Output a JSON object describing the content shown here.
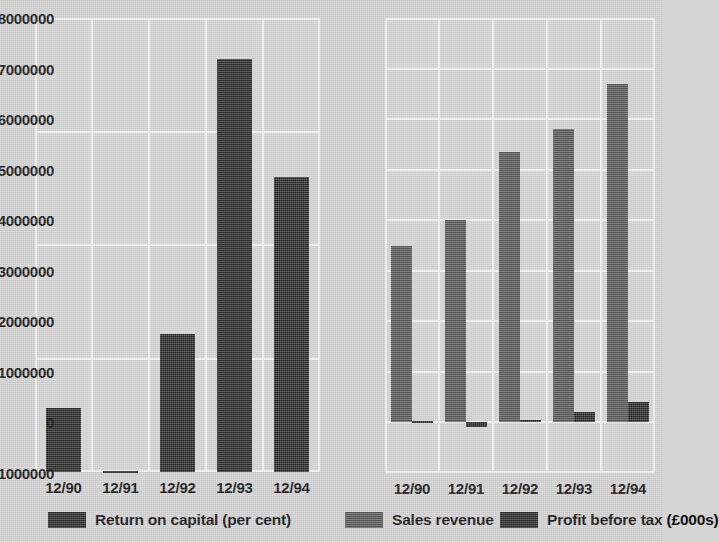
{
  "chart_data": [
    {
      "type": "bar",
      "title": "",
      "id": "return-on-capital",
      "position": "left",
      "categories": [
        "12/90",
        "12/91",
        "12/92",
        "12/93",
        "12/94"
      ],
      "series": [
        {
          "name": "Return on capital (per cent)",
          "color": "#2e2e2e",
          "values": [
            2.8,
            0.05,
            6.1,
            18.2,
            13.0
          ]
        }
      ],
      "xlabel": "",
      "ylabel": "",
      "ylim": [
        0,
        20
      ],
      "yticks": [
        0,
        5,
        10,
        15,
        20
      ],
      "ytick_labels": [
        "0",
        "5",
        "10",
        "15",
        "20"
      ],
      "grid": true,
      "legend_position": "bottom"
    },
    {
      "type": "bar",
      "title": "",
      "id": "sales-and-profit",
      "position": "right",
      "categories": [
        "12/90",
        "12/91",
        "12/92",
        "12/93",
        "12/94"
      ],
      "series": [
        {
          "name": "Sales revenue",
          "color": "#5d5d5d",
          "values": [
            3500000,
            4000000,
            5350000,
            5800000,
            6700000
          ]
        },
        {
          "name": "Profit before tax  (£000s)",
          "color": "#2e2e2e",
          "values": [
            20000,
            -100000,
            45000,
            200000,
            400000
          ]
        }
      ],
      "xlabel": "",
      "ylabel": "",
      "ylim": [
        -1000000,
        8000000
      ],
      "yticks": [
        -1000000,
        0,
        1000000,
        2000000,
        3000000,
        4000000,
        5000000,
        6000000,
        7000000,
        8000000
      ],
      "ytick_labels": [
        "-1000000",
        "0",
        "1000000",
        "2000000",
        "3000000",
        "4000000",
        "5000000",
        "6000000",
        "7000000",
        "8000000"
      ],
      "grid": true,
      "legend_position": "bottom"
    }
  ],
  "left_chart": {
    "yticks": [
      {
        "label": "20",
        "value": 20
      },
      {
        "label": "15",
        "value": 15
      },
      {
        "label": "10",
        "value": 10
      },
      {
        "label": "5",
        "value": 5
      },
      {
        "label": "0",
        "value": 0
      }
    ],
    "xticks": [
      {
        "label": "12/90"
      },
      {
        "label": "12/91"
      },
      {
        "label": "12/92"
      },
      {
        "label": "12/93"
      },
      {
        "label": "12/94"
      }
    ]
  },
  "right_chart": {
    "yticks": [
      {
        "label": "8000000",
        "value": 8000000
      },
      {
        "label": "7000000",
        "value": 7000000
      },
      {
        "label": "6000000",
        "value": 6000000
      },
      {
        "label": "5000000",
        "value": 5000000
      },
      {
        "label": "4000000",
        "value": 4000000
      },
      {
        "label": "3000000",
        "value": 3000000
      },
      {
        "label": "2000000",
        "value": 2000000
      },
      {
        "label": "1000000",
        "value": 1000000
      },
      {
        "label": "0",
        "value": 0
      },
      {
        "label": "-1000000",
        "value": -1000000
      }
    ],
    "xticks": [
      {
        "label": "12/90"
      },
      {
        "label": "12/91"
      },
      {
        "label": "12/92"
      },
      {
        "label": "12/93"
      },
      {
        "label": "12/94"
      }
    ]
  },
  "legend": {
    "items": [
      {
        "label": "Return on capital (per cent)",
        "color": "#2e2e2e",
        "swatch": "dark"
      },
      {
        "label": "Sales revenue",
        "color": "#5d5d5d",
        "swatch": "gray"
      },
      {
        "label": "Profit before tax  (£000s)",
        "color": "#2e2e2e",
        "swatch": "dark"
      }
    ]
  },
  "colors": {
    "background": "#d4d4d4",
    "plot_background": "#d6d6d6",
    "gridline": "#f4f4f4",
    "series_dark": "#2e2e2e",
    "series_gray": "#5d5d5d",
    "text": "#111111"
  }
}
